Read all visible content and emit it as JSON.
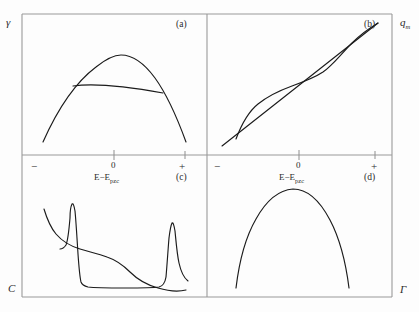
{
  "figure": {
    "background_color": "#fdfdfd",
    "curve_color": "#1b1b1b",
    "frame_color": "#9a9a9a",
    "x_axis_label": "E−E",
    "x_axis_label_subscript": "pzc",
    "zero_marker": "0",
    "negative_sign": "−",
    "positive_sign": "+"
  },
  "panels": [
    {
      "tag": "(a)",
      "y_axis_label": "γ",
      "y_axis_label_position": "top-left",
      "quantity": "surface tension",
      "curves": [
        {
          "name": "electrocapillary-parabola",
          "shape": "inverted-parabola"
        },
        {
          "name": "tangent-chord",
          "shape": "near-horizontal-chord"
        }
      ]
    },
    {
      "tag": "(b)",
      "y_axis_label": "q",
      "y_axis_label_subscript": "m",
      "y_axis_label_position": "top-right",
      "quantity": "metal charge density",
      "curves": [
        {
          "name": "straight-line",
          "shape": "diagonal-line"
        },
        {
          "name": "sigmoid-curve",
          "shape": "s-shaped"
        }
      ]
    },
    {
      "tag": "(c)",
      "y_axis_label": "C",
      "y_axis_label_position": "bottom-left",
      "quantity": "capacitance",
      "curves": [
        {
          "name": "smooth-decay-curve",
          "shape": "monotonic-decay"
        },
        {
          "name": "double-peak-curve",
          "shape": "flat-bottom-with-two-peaks"
        }
      ]
    },
    {
      "tag": "(d)",
      "y_axis_label": "Γ",
      "y_axis_label_position": "bottom-right",
      "quantity": "surface excess",
      "curves": [
        {
          "name": "surface-excess-dome",
          "shape": "inverted-parabola"
        }
      ]
    }
  ]
}
